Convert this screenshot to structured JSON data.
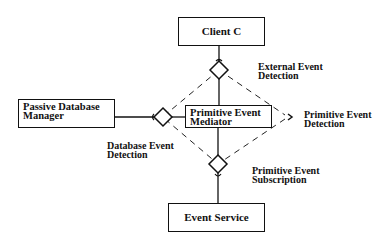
{
  "boxes": {
    "client": {
      "label": "Client C"
    },
    "mediator": {
      "line1": "Primitive Event",
      "line2": "Mediator"
    },
    "db_manager": {
      "line1": "Passive Database",
      "line2": "Manager"
    },
    "event_service": {
      "label": "Event Service"
    }
  },
  "labels": {
    "external": {
      "line1": "External Event",
      "line2": "Detection"
    },
    "primitive_detection": {
      "line1": "Primitive Event",
      "line2": "Detection"
    },
    "database_detection": {
      "line1": "Database Event",
      "line2": "Detection"
    },
    "subscription": {
      "line1": "Primitive Event",
      "line2": "Subscription"
    }
  },
  "colors": {
    "stroke": "#111111",
    "background": "#ffffff"
  }
}
